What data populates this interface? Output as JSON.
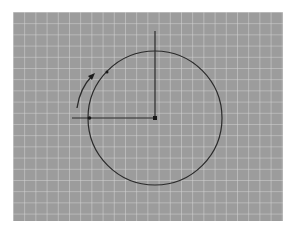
{
  "diagram": {
    "type": "rotation-on-grid",
    "colors": {
      "background": "#ffffff",
      "grid_fill": "#9c9c9c",
      "grid_line": "#d6d6d6",
      "stroke": "#2a2a2a"
    },
    "grid": {
      "x": 13,
      "y": 12,
      "width": 270,
      "height": 209,
      "spacing": 11.2
    },
    "circle": {
      "cx": 155,
      "cy": 118,
      "r": 67
    },
    "center_point": {
      "x": 155,
      "y": 118
    },
    "horizontal_line": {
      "x1": 72,
      "y1": 118,
      "x2": 155,
      "y2": 118
    },
    "vertical_line": {
      "x1": 155,
      "y1": 31,
      "x2": 155,
      "y2": 118
    },
    "circle_point": {
      "x": 90,
      "y": 118
    },
    "rotation_arrow": {
      "direction": "counter-clockwise",
      "from": [
        77,
        108
      ],
      "to": [
        93,
        75
      ]
    }
  }
}
